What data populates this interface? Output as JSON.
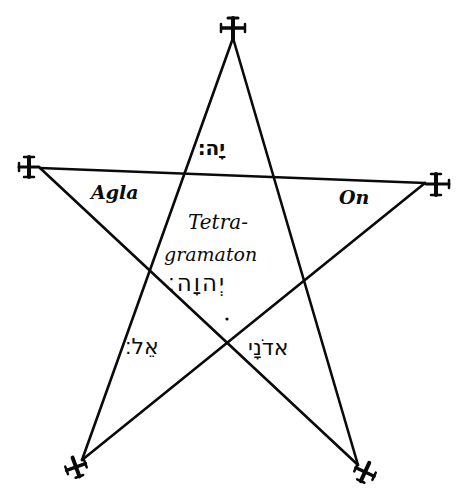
{
  "figure": {
    "type": "pentagram",
    "ink_color": "#0a0a0a",
    "background": "#ffffff",
    "vertices": [
      {
        "name": "top",
        "x": 233,
        "y": 38
      },
      {
        "name": "right",
        "x": 425,
        "y": 183
      },
      {
        "name": "bottom-left",
        "x": 82,
        "y": 460
      },
      {
        "name": "left",
        "x": 40,
        "y": 168
      },
      {
        "name": "bottom-right",
        "x": 358,
        "y": 465
      }
    ],
    "vertex_ornament": "cross-potent"
  },
  "labels": {
    "top_point": "יָה׃",
    "left_point": "Agla",
    "right_point": "On",
    "center_line1": "Tetra-",
    "center_line2": "gramaton",
    "center_hebrew": "יְהוָה׃",
    "bottom_left": "אֵל׃",
    "bottom_right": "אדֹנָי"
  }
}
